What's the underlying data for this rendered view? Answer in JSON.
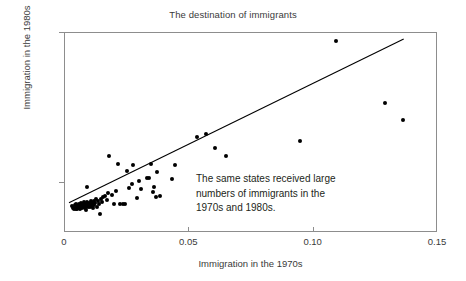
{
  "chart_data": {
    "type": "scatter",
    "title": "The destination of immigrants",
    "xlabel": "Immigration in the 1970s",
    "ylabel": "Immigration in the 1980s",
    "xlim": [
      0,
      0.15
    ],
    "ylim": [
      -0.02,
      0.14
    ],
    "xticks": [
      "0",
      "0.05",
      "0.10",
      "0.15"
    ],
    "xtick_values": [
      0,
      0.05,
      0.1,
      0.15
    ],
    "yticks": [
      "-0.02",
      "0.02",
      "0.06",
      "0.10",
      "0.14"
    ],
    "ytick_values": [
      -0.02,
      0.02,
      0.06,
      0.1,
      0.14
    ],
    "grid": false,
    "legend": "none",
    "annotations": [
      "The same states received large",
      "numbers of immigrants in the",
      "1970s and 1980s."
    ],
    "trendline": {
      "name": "fitted regression line",
      "x_start": 0.0016,
      "y_start": 0.0042,
      "x_end": 0.1362,
      "y_end": 0.1352
    },
    "series": [
      {
        "name": "states",
        "marker": "filled-circle",
        "color": "#000000",
        "points": [
          [
            0.003,
            0.0014
          ],
          [
            0.0034,
            0.0004
          ],
          [
            0.0036,
            -0.0008
          ],
          [
            0.004,
            0.0022
          ],
          [
            0.0042,
            0.0004
          ],
          [
            0.0044,
            -0.001
          ],
          [
            0.0046,
            0.003
          ],
          [
            0.0048,
            0.0012
          ],
          [
            0.005,
            -0.0004
          ],
          [
            0.0052,
            0.002
          ],
          [
            0.0054,
            0.0002
          ],
          [
            0.0056,
            0.0034
          ],
          [
            0.0058,
            0.0014
          ],
          [
            0.006,
            -0.0006
          ],
          [
            0.0062,
            0.0026
          ],
          [
            0.0064,
            0.0006
          ],
          [
            0.0066,
            0.004
          ],
          [
            0.0068,
            0.0018
          ],
          [
            0.007,
            -0.0002
          ],
          [
            0.0072,
            0.003
          ],
          [
            0.0074,
            0.001
          ],
          [
            0.0076,
            0.0046
          ],
          [
            0.0078,
            0.0022
          ],
          [
            0.008,
            0.0002
          ],
          [
            0.0082,
            0.0036
          ],
          [
            0.0084,
            0.0014
          ],
          [
            0.0086,
            -0.0012
          ],
          [
            0.0088,
            0.0026
          ],
          [
            0.009,
            0.005
          ],
          [
            0.0092,
            0.0008
          ],
          [
            0.0094,
            0.0032
          ],
          [
            0.0096,
            0.0018
          ],
          [
            0.0098,
            0.0044
          ],
          [
            0.01,
            0.0006
          ],
          [
            0.0104,
            0.0028
          ],
          [
            0.0106,
            0.006
          ],
          [
            0.0108,
            0.0016
          ],
          [
            0.011,
            0.0038
          ],
          [
            0.0112,
            0.0002
          ],
          [
            0.0116,
            0.0054
          ],
          [
            0.0118,
            0.0024
          ],
          [
            0.0122,
            0.0042
          ],
          [
            0.0126,
            0.007
          ],
          [
            0.0128,
            0.0012
          ],
          [
            0.009,
            0.0166
          ],
          [
            0.0132,
            0.006
          ],
          [
            0.0136,
            0.0034
          ],
          [
            0.014,
            -0.0048
          ],
          [
            0.0144,
            0.0076
          ],
          [
            0.015,
            0.0052
          ],
          [
            0.0154,
            0.0088
          ],
          [
            0.016,
            0.0096
          ],
          [
            0.0168,
            0.0066
          ],
          [
            0.0172,
            0.012
          ],
          [
            0.0178,
            0.0416
          ],
          [
            0.019,
            0.0106
          ],
          [
            0.0196,
            0.0032
          ],
          [
            0.0206,
            0.014
          ],
          [
            0.0212,
            0.0352
          ],
          [
            0.0222,
            0.0034
          ],
          [
            0.0234,
            0.0036
          ],
          [
            0.0242,
            0.0034
          ],
          [
            0.025,
            0.03
          ],
          [
            0.0256,
            0.0164
          ],
          [
            0.0268,
            0.0196
          ],
          [
            0.0272,
            0.0342
          ],
          [
            0.029,
            0.008
          ],
          [
            0.0298,
            0.0216
          ],
          [
            0.0306,
            0.0152
          ],
          [
            0.033,
            0.024
          ],
          [
            0.0338,
            0.0244
          ],
          [
            0.0344,
            0.0354
          ],
          [
            0.0352,
            0.013
          ],
          [
            0.0356,
            0.0168
          ],
          [
            0.0364,
            0.0086
          ],
          [
            0.037,
            0.0286
          ],
          [
            0.0382,
            0.0098
          ],
          [
            0.043,
            0.0232
          ],
          [
            0.0442,
            0.0344
          ],
          [
            0.053,
            0.057
          ],
          [
            0.0568,
            0.0596
          ],
          [
            0.0604,
            0.0484
          ],
          [
            0.0648,
            0.0414
          ],
          [
            0.0944,
            0.0538
          ],
          [
            0.1088,
            0.1338
          ],
          [
            0.1288,
            0.0838
          ],
          [
            0.1358,
            0.0702
          ]
        ]
      }
    ]
  }
}
